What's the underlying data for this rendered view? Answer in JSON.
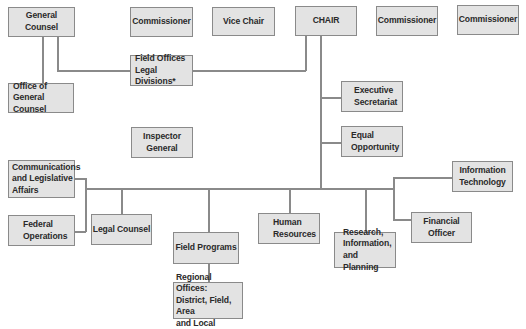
{
  "diagram": {
    "type": "org-chart",
    "colors": {
      "box_fill": "#e3e3e3",
      "box_border": "#8a8a8a",
      "line": "#8a8a8a",
      "text": "#2a2a2a"
    },
    "nodes": {
      "general_counsel": "General Counsel",
      "commissioner_1": "Commissioner",
      "vice_chair": "Vice Chair",
      "chair": "CHAIR",
      "commissioner_2": "Commissioner",
      "commissioner_3": "Commissioner",
      "field_offices_legal": "Field Offices\nLegal Divisions*",
      "office_general_counsel": "Office of\nGeneral Counsel",
      "executive_secretariat": "Executive\nSecretariat",
      "inspector_general": "Inspector\nGeneral",
      "equal_opportunity": "Equal\nOpportunity",
      "communications": "Communications\nand Legislative\nAffairs",
      "information_technology": "Information\nTechnology",
      "federal_operations": "Federal\nOperations",
      "legal_counsel": "Legal Counsel",
      "human_resources": "Human\nResources",
      "financial_officer": "Financial Officer",
      "field_programs": "Field Programs",
      "research": "Research,\nInformation,\nand Planning",
      "regional_offices": "Regional Offices:\nDistrict, Field, Area\nand Local"
    },
    "edges": [
      [
        "general_counsel",
        "office_general_counsel"
      ],
      [
        "general_counsel",
        "field_offices_legal"
      ],
      [
        "chair",
        "field_offices_legal"
      ],
      [
        "chair",
        "executive_secretariat"
      ],
      [
        "chair",
        "equal_opportunity"
      ],
      [
        "chair",
        "communications"
      ],
      [
        "chair",
        "federal_operations"
      ],
      [
        "chair",
        "legal_counsel"
      ],
      [
        "chair",
        "field_programs"
      ],
      [
        "chair",
        "human_resources"
      ],
      [
        "chair",
        "research"
      ],
      [
        "chair",
        "information_technology"
      ],
      [
        "chair",
        "financial_officer"
      ],
      [
        "field_programs",
        "regional_offices"
      ]
    ]
  }
}
